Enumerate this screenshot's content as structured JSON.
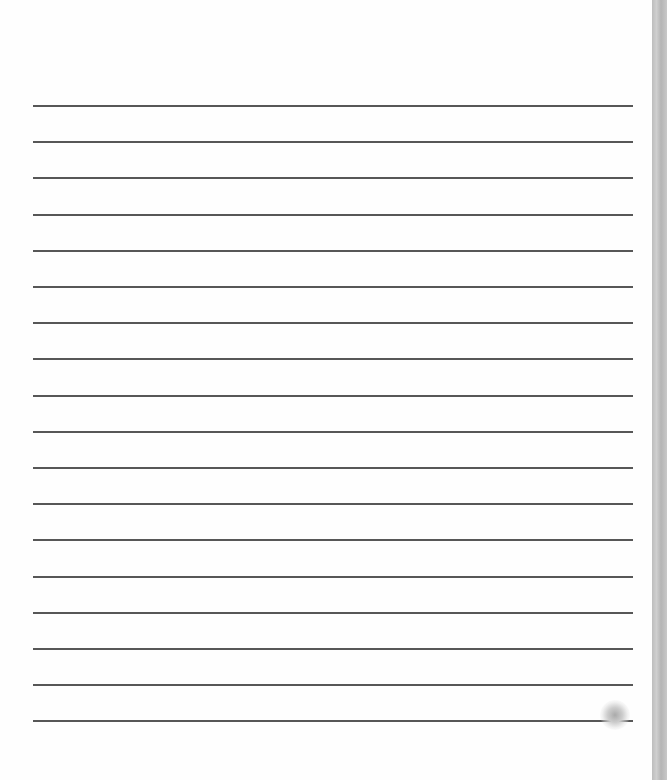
{
  "document": {
    "type": "lined-paper",
    "line_count": 18,
    "line_top": 105,
    "line_spacing": 36.2,
    "line_color": "#3a3a3a",
    "edge_color": "#c0c0c0"
  }
}
